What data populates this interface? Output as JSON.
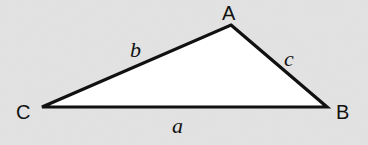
{
  "diagram": {
    "type": "triangle",
    "background_color": "#e6e6e6",
    "fill_color": "#ffffff",
    "stroke_color": "#111111",
    "vertices": [
      {
        "id": "A",
        "label": "A",
        "x": 231,
        "y": 25
      },
      {
        "id": "B",
        "label": "B",
        "x": 327,
        "y": 107
      },
      {
        "id": "C",
        "label": "C",
        "x": 42,
        "y": 107
      }
    ],
    "sides": [
      {
        "id": "a",
        "label": "a",
        "from": "C",
        "to": "B"
      },
      {
        "id": "b",
        "label": "b",
        "from": "C",
        "to": "A"
      },
      {
        "id": "c",
        "label": "c",
        "from": "A",
        "to": "B"
      }
    ]
  }
}
